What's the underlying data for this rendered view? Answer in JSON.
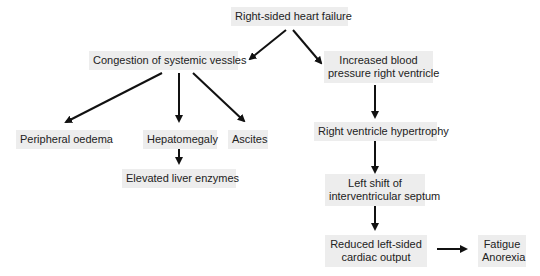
{
  "diagram": {
    "type": "flowchart",
    "nodes": {
      "root": {
        "label": "Right-sided heart failure"
      },
      "congestion": {
        "label": "Congestion of systemic vessles"
      },
      "increased_bp": {
        "line1": "Increased blood",
        "line2": "pressure right ventricle"
      },
      "peripheral": {
        "label": "Peripheral oedema"
      },
      "hepatomegaly": {
        "label": "Hepatomegaly"
      },
      "ascites": {
        "label": "Ascites"
      },
      "liver_enzymes": {
        "label": "Elevated liver enzymes"
      },
      "rv_hypertrophy": {
        "label": "Right ventricle hypertrophy"
      },
      "left_shift": {
        "line1": "Left shift of",
        "line2": "interventricular septum"
      },
      "reduced_output": {
        "line1": "Reduced left-sided",
        "line2": "cardiac output"
      },
      "fatigue": {
        "line1": "Fatigue",
        "line2": "Anorexia"
      }
    },
    "edges": [
      {
        "from": "root",
        "to": "congestion"
      },
      {
        "from": "root",
        "to": "increased_bp"
      },
      {
        "from": "congestion",
        "to": "peripheral"
      },
      {
        "from": "congestion",
        "to": "hepatomegaly"
      },
      {
        "from": "congestion",
        "to": "ascites"
      },
      {
        "from": "hepatomegaly",
        "to": "liver_enzymes"
      },
      {
        "from": "increased_bp",
        "to": "rv_hypertrophy"
      },
      {
        "from": "rv_hypertrophy",
        "to": "left_shift"
      },
      {
        "from": "left_shift",
        "to": "reduced_output"
      },
      {
        "from": "reduced_output",
        "to": "fatigue"
      }
    ],
    "colors": {
      "node_fill": "#ededed",
      "arrow": "#111111",
      "text": "#222222"
    }
  }
}
